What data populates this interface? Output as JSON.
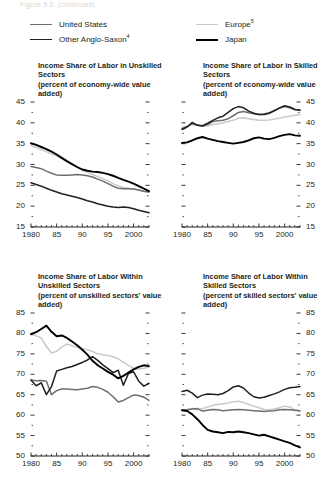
{
  "figure": {
    "cut_title": "Figure 5.8. (continued)",
    "legend": [
      {
        "key": "us",
        "label": "United States",
        "note": "",
        "color": "#6d6e70",
        "width": 1.9
      },
      {
        "key": "oas",
        "label": "Other Anglo-Saxon",
        "note": "4",
        "color": "#231f20",
        "width": 1.9
      },
      {
        "key": "europe",
        "label": "Europe",
        "note": "5",
        "color": "#c9cacb",
        "width": 1.9
      },
      {
        "key": "japan",
        "label": "Japan",
        "note": "",
        "color": "#000000",
        "width": 2.2
      }
    ]
  },
  "chart_data": [
    {
      "id": "top-left",
      "type": "line",
      "title": "Income Share of Labor in Unskilled Sectors",
      "subtitle": "(percent of economy-wide value added)",
      "xlabel": "",
      "ylabel": "",
      "xlim": [
        1980,
        2003
      ],
      "ylim": [
        15,
        45
      ],
      "yticks": [
        15,
        20,
        25,
        30,
        35,
        40,
        45
      ],
      "ytick_side": "left",
      "xticks": [
        1980,
        1985,
        1990,
        1995,
        2000
      ],
      "xtick_labels": [
        "1980",
        "85",
        "90",
        "95",
        "2000"
      ],
      "grid": false,
      "legend_position": "figure-top",
      "x": [
        1980,
        1981,
        1982,
        1983,
        1984,
        1985,
        1986,
        1987,
        1988,
        1989,
        1990,
        1991,
        1992,
        1993,
        1994,
        1995,
        1996,
        1997,
        1998,
        1999,
        2000,
        2001,
        2002,
        2003
      ],
      "series": [
        {
          "name": "United States",
          "color": "#6d6e70",
          "values": [
            29.5,
            29.3,
            29.0,
            28.4,
            27.9,
            27.5,
            27.4,
            27.4,
            27.5,
            27.6,
            27.5,
            27.3,
            27.0,
            26.5,
            26.0,
            25.4,
            24.8,
            24.3,
            24.2,
            24.2,
            24.1,
            23.9,
            23.6,
            23.4
          ]
        },
        {
          "name": "Other Anglo-Saxon",
          "color": "#231f20",
          "values": [
            25.6,
            25.2,
            24.8,
            24.3,
            23.8,
            23.4,
            23.0,
            22.7,
            22.4,
            22.1,
            21.7,
            21.3,
            21.0,
            20.6,
            20.3,
            20.0,
            19.8,
            19.7,
            19.8,
            19.7,
            19.4,
            19.0,
            18.7,
            18.4
          ]
        },
        {
          "name": "Europe",
          "color": "#c9cacb",
          "values": [
            34.5,
            34.1,
            33.6,
            33.1,
            32.5,
            32.0,
            31.4,
            30.7,
            30.0,
            29.3,
            28.6,
            28.1,
            27.6,
            27.1,
            26.6,
            26.0,
            25.4,
            24.9,
            24.5,
            24.3,
            24.1,
            23.8,
            23.5,
            23.4
          ]
        },
        {
          "name": "Japan",
          "color": "#000000",
          "values": [
            35.1,
            34.7,
            34.2,
            33.7,
            33.1,
            32.4,
            31.6,
            30.8,
            30.1,
            29.4,
            28.8,
            28.5,
            28.3,
            28.2,
            28.0,
            27.7,
            27.3,
            26.8,
            26.3,
            25.9,
            25.4,
            24.8,
            24.2,
            23.6
          ]
        }
      ]
    },
    {
      "id": "top-right",
      "type": "line",
      "title": "Income Share of Labor in Skilled Sectors",
      "subtitle": "(percent of economy-wide value added)",
      "xlabel": "",
      "ylabel": "",
      "xlim": [
        1980,
        2003
      ],
      "ylim": [
        15,
        45
      ],
      "yticks": [
        15,
        20,
        25,
        30,
        35,
        40,
        45
      ],
      "ytick_side": "right",
      "xticks": [
        1980,
        1985,
        1990,
        1995,
        2000
      ],
      "xtick_labels": [
        "1980",
        "85",
        "90",
        "95",
        "2000"
      ],
      "grid": false,
      "legend_position": "figure-top",
      "x": [
        1980,
        1981,
        1982,
        1983,
        1984,
        1985,
        1986,
        1987,
        1988,
        1989,
        1990,
        1991,
        1992,
        1993,
        1994,
        1995,
        1996,
        1997,
        1998,
        1999,
        2000,
        2001,
        2002,
        2003
      ],
      "series": [
        {
          "name": "United States",
          "color": "#6d6e70",
          "values": [
            38.6,
            39.1,
            39.8,
            39.5,
            39.2,
            39.6,
            40.3,
            40.5,
            40.6,
            41.0,
            41.7,
            42.5,
            42.7,
            42.4,
            42.2,
            42.0,
            42.1,
            42.4,
            43.0,
            43.5,
            43.9,
            43.6,
            43.2,
            43.1
          ]
        },
        {
          "name": "Other Anglo-Saxon",
          "color": "#231f20",
          "values": [
            38.4,
            39.0,
            40.1,
            39.4,
            39.3,
            39.9,
            40.6,
            41.2,
            41.6,
            42.5,
            43.4,
            43.9,
            43.6,
            42.8,
            42.3,
            42.0,
            42.0,
            42.3,
            42.9,
            43.6,
            44.1,
            43.8,
            43.2,
            43.0
          ]
        },
        {
          "name": "Europe",
          "color": "#c9cacb",
          "values": [
            39.0,
            39.2,
            39.6,
            39.4,
            39.2,
            39.3,
            39.6,
            39.8,
            40.0,
            40.3,
            40.6,
            41.1,
            41.2,
            41.0,
            40.8,
            40.6,
            40.6,
            40.7,
            40.9,
            41.1,
            41.4,
            41.6,
            41.8,
            42.0
          ]
        },
        {
          "name": "Japan",
          "color": "#000000",
          "values": [
            35.2,
            35.3,
            35.8,
            36.3,
            36.6,
            36.2,
            35.9,
            35.6,
            35.4,
            35.2,
            35.0,
            35.2,
            35.4,
            35.8,
            36.3,
            36.5,
            36.2,
            36.1,
            36.4,
            36.8,
            37.1,
            37.3,
            37.0,
            36.9
          ]
        }
      ]
    },
    {
      "id": "bottom-left",
      "type": "line",
      "title": "Income Share of Labor Within Unskilled Sectors",
      "subtitle": "(percent of unskilled sectors' value added)",
      "xlabel": "",
      "ylabel": "",
      "xlim": [
        1980,
        2003
      ],
      "ylim": [
        50,
        85
      ],
      "yticks": [
        50,
        55,
        60,
        65,
        70,
        75,
        80,
        85
      ],
      "ytick_side": "left",
      "xticks": [
        1980,
        1985,
        1990,
        1995,
        2000
      ],
      "xtick_labels": [
        "1980",
        "85",
        "90",
        "95",
        "2000"
      ],
      "grid": false,
      "legend_position": "figure-top",
      "x": [
        1980,
        1981,
        1982,
        1983,
        1984,
        1985,
        1986,
        1987,
        1988,
        1989,
        1990,
        1991,
        1992,
        1993,
        1994,
        1995,
        1996,
        1997,
        1998,
        1999,
        2000,
        2001,
        2002,
        2003
      ],
      "series": [
        {
          "name": "United States",
          "color": "#6d6e70",
          "values": [
            68.6,
            68.4,
            68.5,
            68.3,
            65.0,
            66.0,
            66.4,
            66.4,
            66.3,
            66.2,
            66.4,
            66.6,
            67.0,
            66.8,
            66.3,
            65.6,
            64.5,
            63.2,
            63.6,
            64.3,
            64.9,
            64.8,
            64.4,
            63.6
          ]
        },
        {
          "name": "Other Anglo-Saxon",
          "color": "#231f20",
          "values": [
            68.6,
            67.2,
            67.9,
            65.0,
            67.0,
            70.8,
            71.2,
            71.6,
            71.9,
            72.4,
            72.9,
            73.5,
            74.3,
            73.4,
            72.3,
            71.4,
            70.4,
            71.0,
            67.3,
            70.2,
            70.6,
            68.3,
            67.1,
            67.8
          ]
        },
        {
          "name": "Europe",
          "color": "#c9cacb",
          "values": [
            79.8,
            79.4,
            78.9,
            76.8,
            75.2,
            75.6,
            76.7,
            77.4,
            77.0,
            76.6,
            76.3,
            76.0,
            75.6,
            75.0,
            74.8,
            74.6,
            74.3,
            73.8,
            73.0,
            72.2,
            71.5,
            71.3,
            71.5,
            71.8
          ]
        },
        {
          "name": "Japan",
          "color": "#000000",
          "values": [
            79.8,
            80.3,
            81.1,
            81.9,
            80.4,
            79.3,
            79.5,
            78.9,
            78.0,
            77.1,
            76.0,
            74.8,
            73.3,
            72.2,
            71.4,
            70.6,
            69.9,
            69.0,
            69.6,
            70.4,
            71.2,
            71.8,
            72.2,
            72.0
          ]
        }
      ]
    },
    {
      "id": "bottom-right",
      "type": "line",
      "title": "Income Share of Labor Within Skilled Sectors",
      "subtitle": "(percent of skilled sectors' value added)",
      "xlabel": "",
      "ylabel": "",
      "xlim": [
        1980,
        2003
      ],
      "ylim": [
        50,
        85
      ],
      "yticks": [
        50,
        55,
        60,
        65,
        70,
        75,
        80,
        85
      ],
      "ytick_side": "right",
      "xticks": [
        1980,
        1985,
        1990,
        1995,
        2000
      ],
      "xtick_labels": [
        "1980",
        "85",
        "90",
        "95",
        "2000"
      ],
      "grid": false,
      "legend_position": "figure-top",
      "x": [
        1980,
        1981,
        1982,
        1983,
        1984,
        1985,
        1986,
        1987,
        1988,
        1989,
        1990,
        1991,
        1992,
        1993,
        1994,
        1995,
        1996,
        1997,
        1998,
        1999,
        2000,
        2001,
        2002,
        2003
      ],
      "series": [
        {
          "name": "United States",
          "color": "#6d6e70",
          "values": [
            61.2,
            61.3,
            61.5,
            61.6,
            61.0,
            61.2,
            61.4,
            61.3,
            61.1,
            61.2,
            61.3,
            61.4,
            61.3,
            61.2,
            61.1,
            61.0,
            60.9,
            61.0,
            61.1,
            61.3,
            61.4,
            61.3,
            61.2,
            61.1
          ]
        },
        {
          "name": "Other Anglo-Saxon",
          "color": "#231f20",
          "values": [
            65.8,
            66.1,
            65.4,
            64.3,
            64.9,
            65.2,
            65.1,
            65.0,
            65.3,
            66.0,
            66.9,
            67.2,
            66.6,
            65.4,
            64.5,
            64.2,
            64.4,
            64.8,
            65.2,
            65.7,
            66.3,
            66.7,
            66.8,
            67.0
          ]
        },
        {
          "name": "Europe",
          "color": "#c9cacb",
          "values": [
            61.2,
            61.4,
            61.7,
            61.4,
            61.6,
            62.0,
            62.4,
            62.6,
            62.8,
            63.0,
            63.3,
            63.4,
            63.1,
            62.6,
            62.2,
            61.8,
            61.4,
            61.3,
            61.5,
            61.8,
            62.2,
            62.0,
            61.3,
            60.9
          ]
        },
        {
          "name": "Japan",
          "color": "#000000",
          "values": [
            61.2,
            61.0,
            60.2,
            59.0,
            57.6,
            56.4,
            56.0,
            55.8,
            55.6,
            55.9,
            55.8,
            56.0,
            55.8,
            55.6,
            55.3,
            55.0,
            55.2,
            54.8,
            54.4,
            54.0,
            53.6,
            53.2,
            52.6,
            52.1
          ]
        }
      ]
    }
  ]
}
